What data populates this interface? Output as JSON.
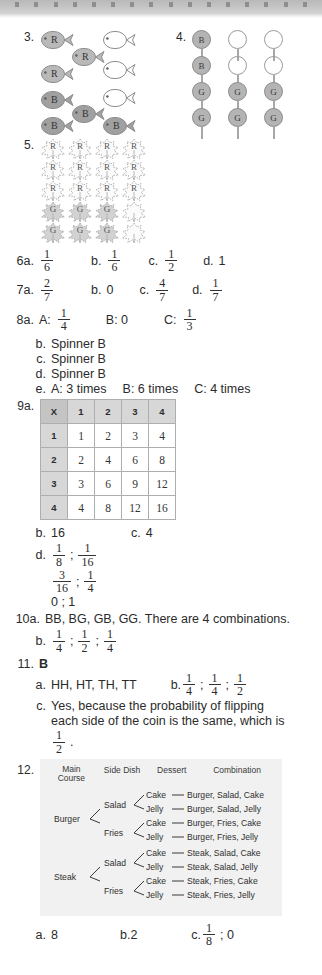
{
  "binding": {
    "holes": 16
  },
  "q3": {
    "number": "3.",
    "fish": [
      {
        "label": "R",
        "shade": "light",
        "x": 0,
        "y": 0
      },
      {
        "label": "",
        "shade": "white",
        "x": 62,
        "y": 0
      },
      {
        "label": "R",
        "shade": "light",
        "x": 31,
        "y": 17
      },
      {
        "label": "R",
        "shade": "light",
        "x": 0,
        "y": 34
      },
      {
        "label": "",
        "shade": "white",
        "x": 62,
        "y": 30
      },
      {
        "label": "B",
        "shade": "dark",
        "x": 0,
        "y": 60
      },
      {
        "label": "",
        "shade": "white",
        "x": 62,
        "y": 58
      },
      {
        "label": "B",
        "shade": "dark",
        "x": 31,
        "y": 74
      },
      {
        "label": "B",
        "shade": "dark",
        "x": 0,
        "y": 86
      },
      {
        "label": "B",
        "shade": "dark",
        "x": 62,
        "y": 86
      }
    ]
  },
  "q4": {
    "number": "4.",
    "balloons": [
      {
        "label": "B",
        "filled": true,
        "col": 0,
        "row": 0
      },
      {
        "label": "",
        "filled": false,
        "col": 1,
        "row": 0
      },
      {
        "label": "",
        "filled": false,
        "col": 2,
        "row": 0
      },
      {
        "label": "B",
        "filled": true,
        "col": 0,
        "row": 1
      },
      {
        "label": "",
        "filled": false,
        "col": 1,
        "row": 1
      },
      {
        "label": "",
        "filled": false,
        "col": 2,
        "row": 1
      },
      {
        "label": "G",
        "filled": true,
        "col": 0,
        "row": 2
      },
      {
        "label": "G",
        "filled": true,
        "col": 1,
        "row": 2
      },
      {
        "label": "G",
        "filled": true,
        "col": 2,
        "row": 2
      },
      {
        "label": "G",
        "filled": true,
        "col": 0,
        "row": 3
      },
      {
        "label": "G",
        "filled": true,
        "col": 1,
        "row": 3
      },
      {
        "label": "G",
        "filled": true,
        "col": 2,
        "row": 3
      }
    ]
  },
  "q5": {
    "number": "5.",
    "leaves": [
      {
        "label": "R",
        "row": 0,
        "col": 0
      },
      {
        "label": "R",
        "row": 0,
        "col": 1
      },
      {
        "label": "R",
        "row": 0,
        "col": 2
      },
      {
        "label": "R",
        "row": 0,
        "col": 3
      },
      {
        "label": "R",
        "row": 1,
        "col": 0
      },
      {
        "label": "R",
        "row": 1,
        "col": 1
      },
      {
        "label": "R",
        "row": 1,
        "col": 2
      },
      {
        "label": "R",
        "row": 1,
        "col": 3
      },
      {
        "label": "R",
        "row": 2,
        "col": 0
      },
      {
        "label": "R",
        "row": 2,
        "col": 1
      },
      {
        "label": "R",
        "row": 2,
        "col": 2
      },
      {
        "label": "R",
        "row": 2,
        "col": 3
      },
      {
        "label": "G",
        "row": 3,
        "col": 0
      },
      {
        "label": "G",
        "row": 3,
        "col": 1
      },
      {
        "label": "G",
        "row": 3,
        "col": 2
      },
      {
        "label": "",
        "row": 3,
        "col": 3
      },
      {
        "label": "G",
        "row": 4,
        "col": 0
      },
      {
        "label": "G",
        "row": 4,
        "col": 1
      },
      {
        "label": "G",
        "row": 4,
        "col": 2
      },
      {
        "label": "",
        "row": 4,
        "col": 3
      }
    ]
  },
  "q6": {
    "lead": "6a.",
    "a": {
      "num": "1",
      "den": "6"
    },
    "b_key": "b.",
    "b": {
      "num": "1",
      "den": "6"
    },
    "c_key": "c.",
    "c": {
      "num": "1",
      "den": "2"
    },
    "d_key": "d.",
    "d": "1"
  },
  "q7": {
    "lead": "7a.",
    "a": {
      "num": "2",
      "den": "7"
    },
    "b_key": "b.",
    "b": "0",
    "c_key": "c.",
    "c": {
      "num": "4",
      "den": "7"
    },
    "d_key": "d.",
    "d": {
      "num": "1",
      "den": "7"
    }
  },
  "q8": {
    "lead": "8a.",
    "a_label": "A:",
    "a": {
      "num": "1",
      "den": "4"
    },
    "b_label": "B: 0",
    "c_label": "C:",
    "c": {
      "num": "1",
      "den": "3"
    },
    "b_key": "b.",
    "b_text": "Spinner B",
    "c_key": "c.",
    "c_text": "Spinner B",
    "d_key": "d.",
    "d_text": "Spinner B",
    "e_key": "e.",
    "e_a": "A: 3 times",
    "e_b": "B:  6 times",
    "e_c": "C:  4 times"
  },
  "q9": {
    "lead": "9a.",
    "table": {
      "corner": "X",
      "col_headers": [
        "1",
        "2",
        "3",
        "4"
      ],
      "row_headers": [
        "1",
        "2",
        "3",
        "4"
      ],
      "cells": [
        [
          "1",
          "2",
          "3",
          "4"
        ],
        [
          "2",
          "4",
          "6",
          "8"
        ],
        [
          "3",
          "6",
          "9",
          "12"
        ],
        [
          "4",
          "8",
          "12",
          "16"
        ]
      ]
    },
    "b_key": "b.",
    "b_text": "16",
    "c_key": "c.",
    "c_text": "4",
    "d_key": "d.",
    "d_1": {
      "num": "1",
      "den": "8"
    },
    "d_2": {
      "num": "1",
      "den": "16"
    },
    "d_3": {
      "num": "3",
      "den": "16"
    },
    "d_4": {
      "num": "1",
      "den": "4"
    },
    "d_5": "0 ; 1",
    "semicolon": ";"
  },
  "q10": {
    "lead": "10a.",
    "a_text": "BB, BG, GB, GG.  There are 4 combinations.",
    "b_key": "b.",
    "b_1": {
      "num": "1",
      "den": "4"
    },
    "b_2": {
      "num": "1",
      "den": "2"
    },
    "b_3": {
      "num": "1",
      "den": "4"
    }
  },
  "q11": {
    "lead": "11.",
    "answer": "B",
    "a_key": "a.",
    "a_text": "HH, HT, TH, TT",
    "b_key": "b.",
    "b_1": {
      "num": "1",
      "den": "4"
    },
    "b_2": {
      "num": "1",
      "den": "4"
    },
    "b_3": {
      "num": "1",
      "den": "2"
    },
    "c_key": "c.",
    "c_line1": "Yes, because the probability of flipping",
    "c_line2": "each side of the coin is the same, which is",
    "c_frac": {
      "num": "1",
      "den": "2"
    },
    "c_period": "."
  },
  "q12": {
    "lead": "12.",
    "headers": {
      "main_course": "Main\nCourse",
      "main_course_l1": "Main",
      "main_course_l2": "Course",
      "side_dish": "Side Dish",
      "dessert": "Dessert",
      "combination": "Combination"
    },
    "mains": [
      "Burger",
      "Steak"
    ],
    "sides": [
      "Salad",
      "Fries"
    ],
    "desserts": [
      "Cake",
      "Jelly"
    ],
    "combinations": [
      "Burger, Salad, Cake",
      "Burger, Salad, Jelly",
      "Burger, Fries, Cake",
      "Burger, Fries, Jelly",
      "Steak, Salad, Cake",
      "Steak, Salad, Jelly",
      "Steak, Fries, Cake",
      "Steak, Fries, Jelly"
    ],
    "a_key": "a.",
    "a_text": "8",
    "b_key": "b.",
    "b_text": "2",
    "c_key": "c.",
    "c_frac": {
      "num": "1",
      "den": "8"
    },
    "c_tail": "; 0"
  },
  "colors": {
    "paper": "#ffffff",
    "binding": "#c6c6c6",
    "table_header": "#d7d7d7",
    "table_corner": "#c4c4c4",
    "tree_box": "#f1f1f1",
    "ink": "#2b2b2b"
  }
}
